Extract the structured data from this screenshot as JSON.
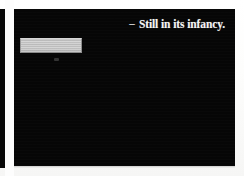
{
  "page": {
    "background_color": "#fbfbfa"
  },
  "adjacent_slide": {
    "background_color": "#080808"
  },
  "slide": {
    "background_color": "#060606",
    "text_color": "#f4f4f4",
    "bullet": {
      "marker": "–",
      "text": "Still in its infancy."
    },
    "placeholder_block": {
      "fill_color": "#c4c4c4",
      "label": ""
    }
  }
}
